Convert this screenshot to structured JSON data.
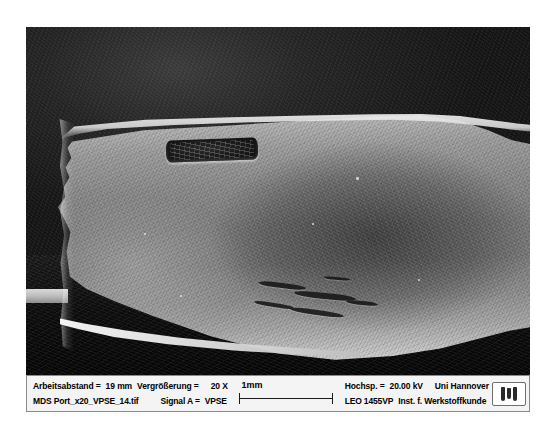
{
  "figure": {
    "kind": "sem-micrograph"
  },
  "info_bar": {
    "left": {
      "working_distance_label": "Arbeitsabstand =",
      "working_distance_value": "19 mm",
      "magnification_label": "Vergrößerung =",
      "magnification_value": "20 X",
      "filename": "MDS Port_x20_VPSE_14.tif",
      "signal_label": "Signal A =",
      "signal_value": "VPSE"
    },
    "scale": {
      "label": "1mm",
      "bar_icon": "scale-bar-icon"
    },
    "right": {
      "voltage_label": "Hochsp. =",
      "voltage_value": "20.00 kV",
      "institution": "Uni Hannover",
      "instrument": "LEO 1455VP",
      "department": "Inst. f. Werkstoffkunde"
    },
    "logo": {
      "name": "leo-logo-icon"
    }
  },
  "colors": {
    "page_background": "#ffffff",
    "micrograph_background": "#111111",
    "specimen_light": "#c9c9c9",
    "specimen_mid": "#7c7c7c",
    "info_bar_background": "#f4f4f4",
    "info_bar_border": "#8a8a8a",
    "text": "#000000"
  }
}
